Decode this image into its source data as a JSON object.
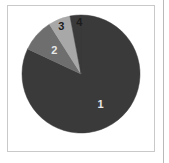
{
  "figure": {
    "frame_border_color": "#c9c9c9",
    "background_color": "#ffffff",
    "panel_divider_color": "#b9b9b9"
  },
  "chart_data": {
    "type": "pie",
    "title": "",
    "subtitle": "",
    "xlabel": "",
    "ylabel": "",
    "grid": false,
    "legend": "none",
    "labels_position": "inside-slices",
    "start_angle_deg": 0,
    "direction": "clockwise",
    "categories": [
      "1",
      "2",
      "3",
      "4"
    ],
    "values": [
      82,
      9,
      6,
      3
    ],
    "units": "percent",
    "slice_angles_deg": [
      295.2,
      32.4,
      21.6,
      10.8
    ],
    "colors": [
      "#3a3a3a",
      "#6e6e6e",
      "#a8a8a8",
      "#3a3a3a"
    ],
    "label_colors": [
      "#e8e8e8",
      "#e8e8e8",
      "#1c1c1c",
      "#1c1c1c"
    ],
    "annotations": [
      {
        "text": "1",
        "slice": "1"
      },
      {
        "text": "2",
        "slice": "2"
      },
      {
        "text": "3",
        "slice": "3"
      },
      {
        "text": "4",
        "slice": "4"
      }
    ]
  },
  "labels": {
    "one": "1",
    "two": "2",
    "three": "3",
    "four": "4"
  }
}
